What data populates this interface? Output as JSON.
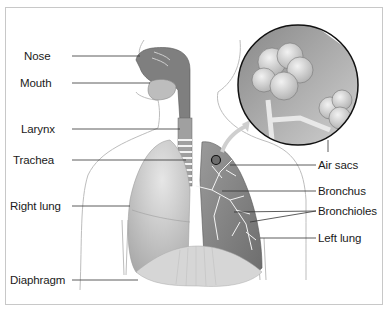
{
  "diagram": {
    "labels_left": [
      {
        "id": "nose",
        "text": "Nose",
        "x": 24,
        "y": 50
      },
      {
        "id": "mouth",
        "text": "Mouth",
        "x": 20,
        "y": 77
      },
      {
        "id": "larynx",
        "text": "Larynx",
        "x": 21,
        "y": 123
      },
      {
        "id": "trachea",
        "text": "Trachea",
        "x": 13,
        "y": 154
      },
      {
        "id": "right-lung",
        "text": "Right lung",
        "x": 10,
        "y": 200
      },
      {
        "id": "diaphragm",
        "text": "Diaphragm",
        "x": 10,
        "y": 274
      }
    ],
    "labels_right": [
      {
        "id": "air-sacs",
        "text": "Air sacs",
        "x": 318,
        "y": 160
      },
      {
        "id": "bronchus",
        "text": "Bronchus",
        "x": 318,
        "y": 186
      },
      {
        "id": "bronchioles",
        "text": "Bronchioles",
        "x": 318,
        "y": 206
      },
      {
        "id": "left-lung",
        "text": "Left lung",
        "x": 318,
        "y": 232
      }
    ],
    "inset": {
      "description": "Magnified view of air sacs (alveoli)"
    },
    "colors": {
      "frame": "#c8c8c8",
      "lung_fill": "#b8b8b8",
      "dark_lung": "#7a7a7a",
      "outline": "#9a9a9a",
      "label_line": "#333333"
    }
  }
}
